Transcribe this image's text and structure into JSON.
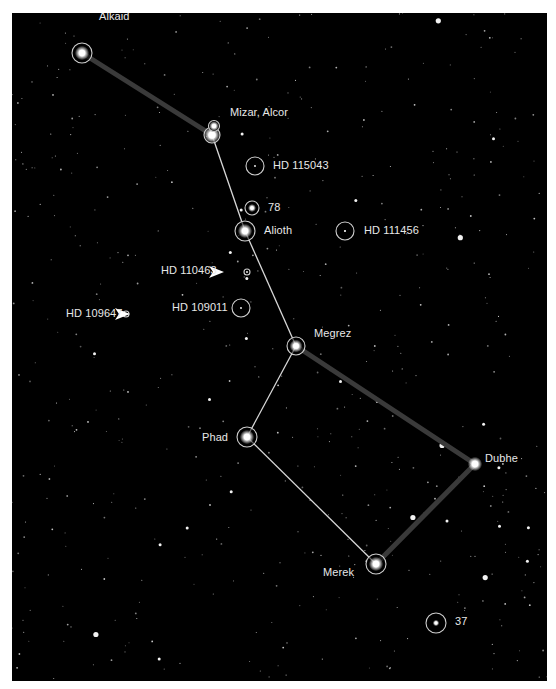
{
  "colors": {
    "background": "#000000",
    "page": "#ffffff",
    "label": "#e8e8e8",
    "thin_line": "#d8d8d8",
    "thick_line": "#3a3a3a",
    "ring": "#cfcfcf"
  },
  "stars": [
    {
      "id": "alkaid",
      "label": "Alkaid",
      "x": 70,
      "y": 40,
      "ring": 10,
      "core": 4.5,
      "lx": 87,
      "ly": 0,
      "ldy": -22
    },
    {
      "id": "mizar",
      "label": "Mizar, Alcor",
      "x": 200,
      "y": 122,
      "ring": 8,
      "core": 5,
      "lx": 218,
      "ly": 0,
      "ldy": -24
    },
    {
      "id": "alcor",
      "label": "",
      "x": 202,
      "y": 113,
      "ring": 5.5,
      "core": 3,
      "lx": 0,
      "ly": 0,
      "ldy": 0
    },
    {
      "id": "hd115043",
      "label": "HD 115043",
      "x": 243,
      "y": 153,
      "ring": 9,
      "core": 1.2,
      "lx": 260,
      "ly": 0,
      "ldy": -7
    },
    {
      "id": "s78",
      "label": "78",
      "x": 240,
      "y": 195,
      "ring": 7,
      "core": 2.5,
      "lx": 256,
      "ly": 0,
      "ldy": -7
    },
    {
      "id": "alioth",
      "label": "Alioth",
      "x": 233,
      "y": 218,
      "ring": 10,
      "core": 4.5,
      "lx": 252,
      "ly": 0,
      "ldy": -6
    },
    {
      "id": "hd111456",
      "label": "HD 111456",
      "x": 333,
      "y": 218,
      "ring": 9,
      "core": 1.5,
      "lx": 351,
      "ly": 0,
      "ldy": -6
    },
    {
      "id": "hd110463",
      "label": "HD 110463",
      "x": 235,
      "y": 259,
      "ring": 3,
      "core": 1,
      "lx": 149,
      "ly": 0,
      "ldy": -7
    },
    {
      "id": "hd109011",
      "label": "HD 109011",
      "x": 229,
      "y": 295,
      "ring": 9,
      "core": 1.2,
      "lx": 160,
      "ly": 0,
      "ldy": -7
    },
    {
      "id": "hd109647",
      "label": "HD 109647",
      "x": 114,
      "y": 301,
      "ring": 3,
      "core": 1,
      "lx": 54,
      "ly": 0,
      "ldy": -7
    },
    {
      "id": "megrez",
      "label": "Megrez",
      "x": 284,
      "y": 333,
      "ring": 9,
      "core": 4,
      "lx": 302,
      "ly": 0,
      "ldy": -20
    },
    {
      "id": "phad",
      "label": "Phad",
      "x": 235,
      "y": 424,
      "ring": 10,
      "core": 4.5,
      "lx": 191,
      "ly": 0,
      "ldy": -7
    },
    {
      "id": "dubhe",
      "label": "Dubhe",
      "x": 463,
      "y": 451,
      "ring": 0,
      "core": 4.5,
      "lx": 474,
      "ly": 0,
      "ldy": -12
    },
    {
      "id": "merek",
      "label": "Merek",
      "x": 364,
      "y": 551,
      "ring": 10,
      "core": 4.5,
      "lx": 311,
      "ly": 0,
      "ldy": 2
    },
    {
      "id": "s37",
      "label": "37",
      "x": 424,
      "y": 610,
      "ring": 10,
      "core": 2,
      "lx": 443,
      "ly": 0,
      "ldy": -8
    }
  ],
  "labels": {
    "alkaid": "Alkaid",
    "mizar_alcor": "Mizar, Alcor",
    "hd115043": "HD 115043",
    "s78": "78",
    "alioth": "Alioth",
    "hd111456": "HD 111456",
    "hd110463": "HD 110463",
    "hd109011": "HD 109011",
    "hd109647": "HD 109647",
    "megrez": "Megrez",
    "phad": "Phad",
    "dubhe": "Dubhe",
    "merek": "Merek",
    "s37": "37"
  },
  "thin_lines": [
    [
      200,
      122,
      233,
      218
    ],
    [
      233,
      218,
      284,
      333
    ],
    [
      284,
      333,
      235,
      424
    ],
    [
      235,
      424,
      364,
      551
    ]
  ],
  "thick_lines": [
    [
      70,
      40,
      200,
      122
    ],
    [
      284,
      333,
      463,
      451
    ],
    [
      463,
      451,
      364,
      551
    ]
  ],
  "pointers": [
    {
      "target": "hd110463",
      "x": 212,
      "y": 259
    },
    {
      "target": "hd109647",
      "x": 118,
      "y": 301
    }
  ]
}
